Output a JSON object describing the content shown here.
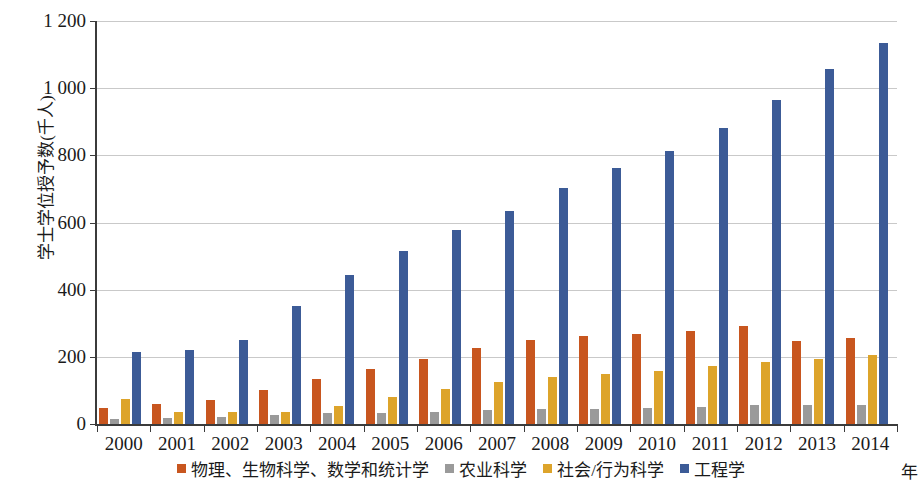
{
  "chart_data": {
    "type": "bar",
    "title": "",
    "subtitle": "",
    "xlabel": "年",
    "ylabel": "学士学位授予数(千人)",
    "categories": [
      "2000",
      "2001",
      "2002",
      "2003",
      "2004",
      "2005",
      "2006",
      "2007",
      "2008",
      "2009",
      "2010",
      "2011",
      "2012",
      "2013",
      "2014"
    ],
    "ylim": [
      0,
      1200
    ],
    "yticks": [
      0,
      200,
      400,
      600,
      800,
      1000,
      1200
    ],
    "ytick_labels": [
      "0",
      "200",
      "400",
      "600",
      "800",
      "1 000",
      "1 200"
    ],
    "grid": true,
    "legend_position": "bottom",
    "series": [
      {
        "name": "物理、生物科学、数学和统计学",
        "color": "#c8561f",
        "values": [
          48,
          61,
          72,
          101,
          134,
          164,
          195,
          226,
          249,
          262,
          268,
          278,
          291,
          246,
          255
        ]
      },
      {
        "name": "农业科学",
        "color": "#9a9a9a",
        "values": [
          16,
          18,
          21,
          26,
          32,
          34,
          36,
          41,
          45,
          46,
          48,
          51,
          56,
          58,
          58
        ]
      },
      {
        "name": "社会/行为科学",
        "color": "#dda42b",
        "values": [
          75,
          35,
          36,
          35,
          54,
          80,
          103,
          124,
          140,
          150,
          157,
          172,
          186,
          194,
          206
        ]
      },
      {
        "name": "工程学",
        "color": "#3c5b97",
        "values": [
          214,
          219,
          250,
          351,
          443,
          515,
          577,
          634,
          703,
          763,
          812,
          881,
          964,
          1058,
          1135
        ]
      }
    ]
  },
  "legend": {
    "items": [
      {
        "label": "物理、生物科学、数学和统计学",
        "color": "#c8561f"
      },
      {
        "label": "农业科学",
        "color": "#9a9a9a"
      },
      {
        "label": "社会/行为科学",
        "color": "#dda42b"
      },
      {
        "label": "工程学",
        "color": "#3c5b97"
      }
    ]
  }
}
